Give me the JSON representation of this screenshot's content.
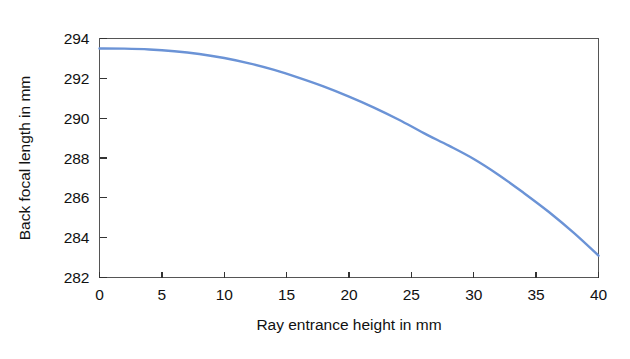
{
  "chart_data": {
    "type": "line",
    "title": "",
    "subtitle": "",
    "xlabel": "Ray entrance height in mm",
    "ylabel": "Back focal length in mm",
    "xlim": [
      0,
      40
    ],
    "ylim": [
      282,
      294
    ],
    "xticks": [
      0,
      5,
      10,
      15,
      20,
      25,
      30,
      35,
      40
    ],
    "xticklabels": [
      "0",
      "5",
      "10",
      "15",
      "20",
      "25",
      "30",
      "35",
      "40"
    ],
    "yticks": [
      282,
      284,
      286,
      288,
      290,
      292,
      294
    ],
    "yticklabels": [
      "282",
      "284",
      "286",
      "288",
      "290",
      "292",
      "294"
    ],
    "grid": false,
    "legend": null,
    "legend_position": "none",
    "annotations": [],
    "series": [
      {
        "name": "Back focal length",
        "color": "#6B93D6",
        "linewidth": 2.4,
        "x": [
          0,
          2,
          4,
          6,
          8,
          10,
          12,
          14,
          16,
          18,
          20,
          22,
          24,
          26,
          28,
          30,
          32,
          34,
          36,
          38,
          40
        ],
        "values": [
          293.5,
          293.49,
          293.45,
          293.36,
          293.22,
          293.02,
          292.75,
          292.42,
          292.02,
          291.58,
          291.08,
          290.53,
          289.92,
          289.25,
          288.62,
          287.95,
          287.15,
          286.25,
          285.3,
          284.25,
          283.1
        ]
      }
    ]
  },
  "figure": {
    "background_color": "#ffffff",
    "axis_color": "#555555",
    "text_color": "#111111"
  }
}
